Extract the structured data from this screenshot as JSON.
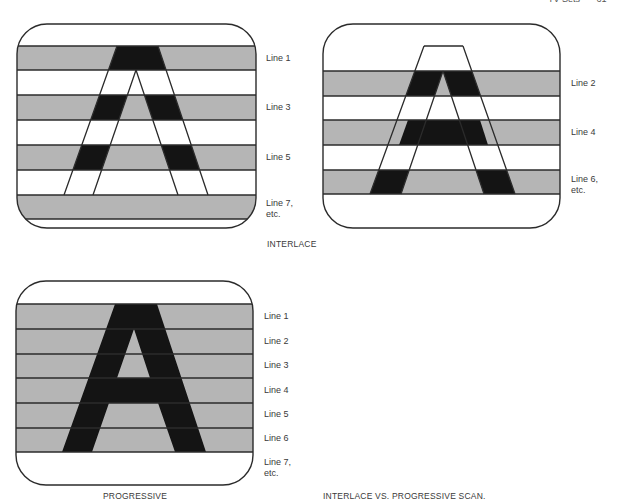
{
  "page_header": {
    "title": "TV Sets",
    "page_number": "61"
  },
  "colors": {
    "gray_band": "#b5b5b5",
    "letter": "#141414",
    "line": "#2b2b2b",
    "background": "#ffffff"
  },
  "figures": [
    {
      "id": "interlace-odd-field",
      "label_lines": [
        "Line 1",
        "Line 3",
        "Line 5",
        "Line 7,\netc."
      ]
    },
    {
      "id": "interlace-even-field",
      "label_lines": [
        "Line 2",
        "Line 4",
        "Line 6,\netc."
      ]
    },
    {
      "id": "progressive",
      "label_lines": [
        "Line 1",
        "Line 2",
        "Line 3",
        "Line 4",
        "Line 5",
        "Line 6",
        "Line 7,\netc."
      ]
    }
  ],
  "captions": {
    "interlace": "INTERLACE",
    "progressive": "PROGRESSIVE",
    "figure_caption": "INTERLACE VS. PROGRESSIVE SCAN."
  }
}
